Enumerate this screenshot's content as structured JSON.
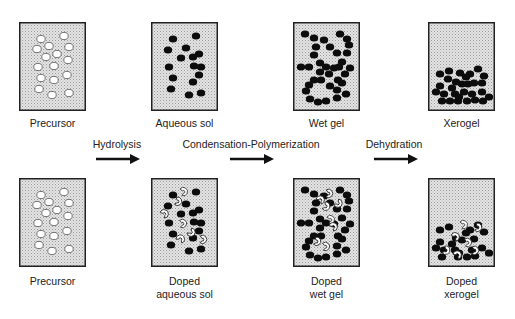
{
  "diagram": {
    "colors": {
      "box_fill": "#d8d8d8",
      "box_stroke": "#222222",
      "particle_dark": "#0c0c0c",
      "particle_light": "#ffffff",
      "arrow": "#111111"
    },
    "steps": [
      {
        "label": "Hydrolysis",
        "label_x": 117,
        "arrow_x1": 96,
        "arrow_x2": 140
      },
      {
        "label": "Condensation-Polymerization",
        "label_x": 251,
        "arrow_x1": 230,
        "arrow_x2": 274
      },
      {
        "label": "Dehydration",
        "label_x": 394,
        "arrow_x1": 374,
        "arrow_x2": 418
      }
    ],
    "top_row": [
      {
        "label": "Precursor",
        "type": "precursor"
      },
      {
        "label": "Aqueous sol",
        "type": "sol"
      },
      {
        "label": "Wet gel",
        "type": "gel"
      },
      {
        "label": "Xerogel",
        "type": "xerogel"
      }
    ],
    "bottom_row": [
      {
        "label": "Precursor",
        "type": "precursor"
      },
      {
        "label": "Doped\naqueous sol",
        "type": "doped_sol"
      },
      {
        "label": "Doped\nwet gel",
        "type": "doped_gel"
      },
      {
        "label": "Doped\nxerogel",
        "type": "doped_xerogel"
      }
    ]
  }
}
